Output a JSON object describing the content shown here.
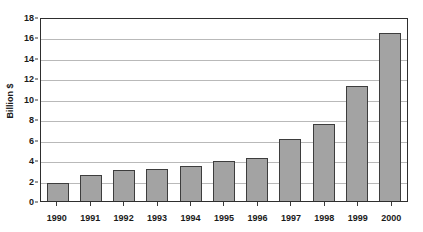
{
  "chart_data": {
    "type": "bar",
    "title": "",
    "subtitle": "",
    "xlabel": "",
    "ylabel": "Billion $",
    "categories": [
      "1990",
      "1991",
      "1992",
      "1993",
      "1994",
      "1995",
      "1996",
      "1997",
      "1998",
      "1999",
      "2000"
    ],
    "values": [
      1.8,
      2.5,
      3.0,
      3.15,
      3.4,
      3.9,
      4.2,
      6.1,
      7.5,
      11.3,
      16.4
    ],
    "ylim": [
      0,
      18
    ],
    "ytick_values": [
      0,
      2,
      4,
      6,
      8,
      10,
      12,
      14,
      16,
      18
    ],
    "ytick_labels": [
      "0",
      "2",
      "4",
      "6",
      "8",
      "10",
      "12",
      "14",
      "16",
      "18"
    ],
    "grid": true,
    "grid_axis": "y",
    "legend": false,
    "legend_position": "none",
    "bar_color": "#a3a3a3",
    "bar_border_color": "#3d3d3d",
    "gridline_color": "#b9b9b9",
    "axis_color": "#2e2e2e",
    "text_color": "#1a1a1a",
    "background_color": "#ffffff"
  }
}
